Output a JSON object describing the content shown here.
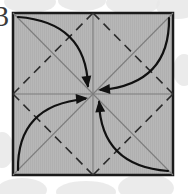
{
  "figure": {
    "kind": "origami-fold-diagram",
    "step_number": "3",
    "caption": "",
    "canvas": {
      "width": 188,
      "height": 194
    }
  },
  "colors": {
    "background": "#ffffff",
    "watermark": "#e8e8e8",
    "paper_fill": "#b5b5b5",
    "paper_stripe": "#aeaeae",
    "paper_border": "#1a1a1a",
    "crease_solid": "#7d7d7d",
    "crease_dashed": "#2b2b2b",
    "arrow": "#111111",
    "step_number": "#3a3a3a"
  },
  "paper": {
    "name": "square-sheet",
    "x": 13,
    "y": 13,
    "width": 160,
    "height": 162,
    "border_width": 2.5
  },
  "creases": {
    "solid": [
      {
        "name": "crease-diagonal-tlbr",
        "x1": 13,
        "y1": 13,
        "x2": 173,
        "y2": 175
      },
      {
        "name": "crease-diagonal-trbl",
        "x1": 173,
        "y1": 13,
        "x2": 13,
        "y2": 175
      },
      {
        "name": "crease-median-horizontal",
        "x1": 13,
        "y1": 94,
        "x2": 173,
        "y2": 94
      },
      {
        "name": "crease-median-vertical",
        "x1": 93,
        "y1": 13,
        "x2": 93,
        "y2": 175
      }
    ],
    "dashed": [
      {
        "name": "crease-dashed-top-left",
        "x1": 93,
        "y1": 13,
        "x2": 13,
        "y2": 94
      },
      {
        "name": "crease-dashed-top-right",
        "x1": 93,
        "y1": 13,
        "x2": 173,
        "y2": 94
      },
      {
        "name": "crease-dashed-bottom-right",
        "x1": 173,
        "y1": 94,
        "x2": 93,
        "y2": 175
      },
      {
        "name": "crease-dashed-bottom-left",
        "x1": 93,
        "y1": 175,
        "x2": 13,
        "y2": 94
      }
    ],
    "dash_pattern": "9 6",
    "solid_width": 1.1,
    "dashed_width": 1.6
  },
  "arrows": [
    {
      "name": "fold-arrow-top-left-to-center",
      "from_corner": "top-left",
      "to": "center",
      "path": "M 18 17 Q 86 22 88 86",
      "head": {
        "x": 88,
        "y": 88,
        "angle": 82
      }
    },
    {
      "name": "fold-arrow-top-right-to-center",
      "from_corner": "top-right",
      "to": "center",
      "path": "M 169 18 Q 170 84 101 90",
      "head": {
        "x": 98,
        "y": 90,
        "angle": 175
      }
    },
    {
      "name": "fold-arrow-bottom-right-to-center",
      "from_corner": "bottom-right",
      "to": "center",
      "path": "M 168 171 Q 101 166 99 102",
      "head": {
        "x": 99,
        "y": 100,
        "angle": -96
      }
    },
    {
      "name": "fold-arrow-bottom-left-to-center",
      "from_corner": "bottom-left",
      "to": "center",
      "path": "M 18 170 Q 17 105 85 99",
      "head": {
        "x": 88,
        "y": 98,
        "angle": -5
      }
    }
  ],
  "watermark_shapes": [
    {
      "name": "watermark-blob-top-left",
      "cx": 30,
      "cy": 2,
      "rx": 26,
      "ry": 11
    },
    {
      "name": "watermark-blob-top-mid",
      "cx": 82,
      "cy": 1,
      "rx": 24,
      "ry": 10
    },
    {
      "name": "watermark-blob-top-right",
      "cx": 133,
      "cy": 3,
      "rx": 27,
      "ry": 12
    },
    {
      "name": "watermark-blob-top-edge",
      "cx": 178,
      "cy": 6,
      "rx": 22,
      "ry": 13
    },
    {
      "name": "watermark-blob-right-mid",
      "cx": 184,
      "cy": 70,
      "rx": 11,
      "ry": 16
    },
    {
      "name": "watermark-blob-bottom-l",
      "cx": 22,
      "cy": 190,
      "rx": 25,
      "ry": 12
    },
    {
      "name": "watermark-blob-bottom-m",
      "cx": 86,
      "cy": 192,
      "rx": 30,
      "ry": 11
    },
    {
      "name": "watermark-blob-bottom-r",
      "cx": 146,
      "cy": 188,
      "rx": 28,
      "ry": 14
    },
    {
      "name": "watermark-blob-left-edge",
      "cx": 2,
      "cy": 150,
      "rx": 12,
      "ry": 18
    }
  ]
}
